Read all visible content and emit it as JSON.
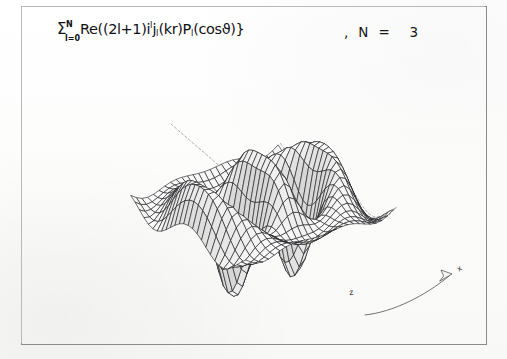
{
  "figure": {
    "kind": "3d-wireframe-surface-plot",
    "background_color": "#fdfdfc",
    "frame_color": "#8b8b8e",
    "line_color": "#1a1a1e",
    "hidden_line_style": "dashed"
  },
  "formula": {
    "full_text": "Σ(l=0..N) Re{(2l+1) i^l j_l(kr) P_l(cosϑ)}",
    "sigma": "Σ",
    "upper_limit": "N",
    "lower_limit": "l=0",
    "body_before_sup": "Re((2l+1)i",
    "sup_l": "l",
    "j_symbol": "j",
    "j_sub": "l",
    "kr": "(kr)P",
    "p_sub": "l",
    "tail": "(cosϑ)}"
  },
  "parameter": {
    "text": ",  N  =    3",
    "name": "N",
    "value": "3"
  },
  "axes": {
    "z_label": "z",
    "x_label": "x",
    "y_label": "y",
    "arrow_name": "curved-axis-arrow"
  },
  "chart_data": {
    "type": "surface",
    "N": 3,
    "function": "sum_{l=0}^{N} Re[(2l+1) i^l j_l(kr) P_l(cos(theta))]",
    "k": 1.0,
    "u_range": [
      -9.0,
      9.0
    ],
    "v_range": [
      -9.0,
      9.0
    ],
    "u_steps": 26,
    "v_steps": 26,
    "zlim": [
      -1.2,
      1.4
    ],
    "grid": true,
    "legend": false,
    "view": {
      "azimuth_deg": 38,
      "elevation_deg": 26,
      "projection": "orthographic"
    },
    "xlabel": "x",
    "ylabel": "y",
    "zlabel": "z"
  }
}
